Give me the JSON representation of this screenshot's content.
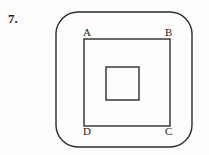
{
  "problem": {
    "number": "7."
  },
  "figure": {
    "name": "nested-squares-in-rounded-square",
    "background_color": "#fdfdfb",
    "stroke_color": "#2b2b2b",
    "outer_shape": {
      "name": "rounded-square",
      "x": 56,
      "y": 12,
      "width": 136,
      "height": 135,
      "corner_radius": 22,
      "stroke_width": 1.4
    },
    "middle_shape": {
      "name": "square-abcd",
      "x": 84,
      "y": 39,
      "width": 86,
      "height": 87,
      "stroke_width": 1.4
    },
    "inner_shape": {
      "name": "small-square",
      "x": 106,
      "y": 67,
      "width": 33,
      "height": 33,
      "stroke_width": 1.4
    },
    "vertex_labels": [
      {
        "id": "a",
        "text": "A",
        "corner": "top-left"
      },
      {
        "id": "b",
        "text": "B",
        "corner": "top-right"
      },
      {
        "id": "c",
        "text": "C",
        "corner": "bottom-right"
      },
      {
        "id": "d",
        "text": "D",
        "corner": "bottom-left"
      }
    ]
  }
}
